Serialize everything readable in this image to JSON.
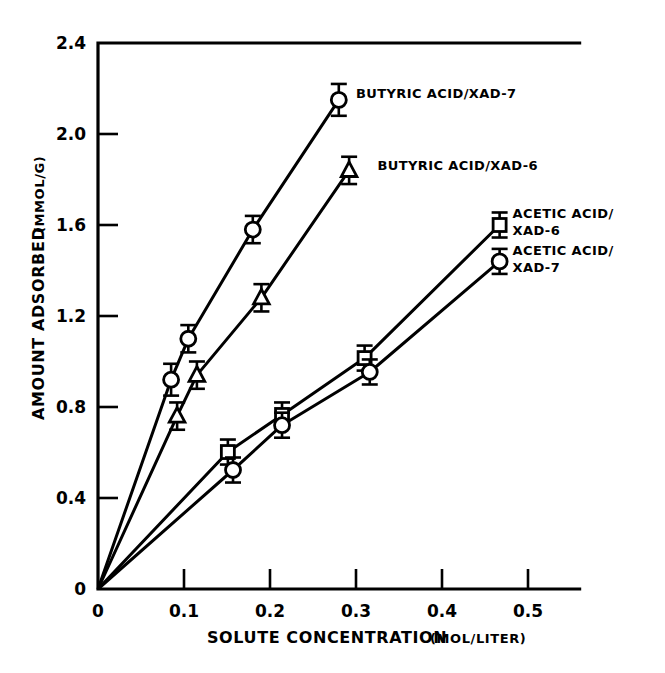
{
  "chart_data": {
    "type": "line",
    "title": "",
    "xlabel": "SOLUTE CONCENTRATION (MOL/LITER)",
    "ylabel": "AMOUNT ADSORBED (MMOL/G)",
    "xlabel_main": "SOLUTE CONCENTRATION",
    "xlabel_units": "(MOL/LITER)",
    "ylabel_main": "AMOUNT ADSORBED",
    "ylabel_units": "(MMOL/G)",
    "xlim": [
      0,
      0.56
    ],
    "ylim": [
      0,
      2.4
    ],
    "xticks": [
      0,
      0.1,
      0.2,
      0.3,
      0.4,
      0.5
    ],
    "xtick_labels": [
      "0",
      "0.1",
      "0.2",
      "0.3",
      "0.4",
      "0.5"
    ],
    "yticks": [
      0,
      0.4,
      0.8,
      1.2,
      1.6,
      2.0,
      2.4
    ],
    "ytick_labels": [
      "0",
      "0.4",
      "0.8",
      "1.2",
      "1.6",
      "2.0",
      "2.4"
    ],
    "grid": false,
    "legend_position": "inline-annotations",
    "line_color": "#000000",
    "marker_fill": "#ffffff",
    "series": [
      {
        "name": "BUTYRIC ACID/XAD-7",
        "marker": "circle",
        "label_x": 0.3,
        "label_y": 2.16,
        "origin_anchored": true,
        "x": [
          0,
          0.085,
          0.105,
          0.18,
          0.28
        ],
        "y": [
          0,
          0.92,
          1.1,
          1.58,
          2.15
        ],
        "yerr": [
          0,
          0.07,
          0.06,
          0.06,
          0.07
        ]
      },
      {
        "name": "BUTYRIC ACID/XAD-6",
        "marker": "triangle",
        "label_x": 0.325,
        "label_y": 1.84,
        "origin_anchored": true,
        "x": [
          0,
          0.092,
          0.115,
          0.19,
          0.292
        ],
        "y": [
          0,
          0.76,
          0.94,
          1.28,
          1.84
        ],
        "yerr": [
          0,
          0.06,
          0.06,
          0.06,
          0.06
        ]
      },
      {
        "name": "ACETIC ACID/ XAD-6",
        "name_line1": "ACETIC ACID/",
        "name_line2": "XAD-6",
        "marker": "square",
        "label_x": 0.482,
        "label_y": 1.63,
        "origin_anchored": true,
        "x": [
          0,
          0.151,
          0.214,
          0.31,
          0.467
        ],
        "y": [
          0,
          0.602,
          0.765,
          1.015,
          1.6
        ],
        "yerr": [
          0,
          0.055,
          0.055,
          0.055,
          0.055
        ]
      },
      {
        "name": "ACETIC ACID/ XAD-7",
        "name_line1": "ACETIC ACID/",
        "name_line2": "XAD-7",
        "marker": "circle",
        "label_x": 0.482,
        "label_y": 1.47,
        "origin_anchored": true,
        "x": [
          0,
          0.157,
          0.214,
          0.316,
          0.467
        ],
        "y": [
          0,
          0.523,
          0.72,
          0.954,
          1.44
        ],
        "yerr": [
          0,
          0.055,
          0.055,
          0.055,
          0.055
        ]
      }
    ]
  },
  "axes": {
    "x_title": "SOLUTE CONCENTRATION (MOL/LITER)",
    "y_title": "AMOUNT ADSORBED (MMOL/G)"
  }
}
